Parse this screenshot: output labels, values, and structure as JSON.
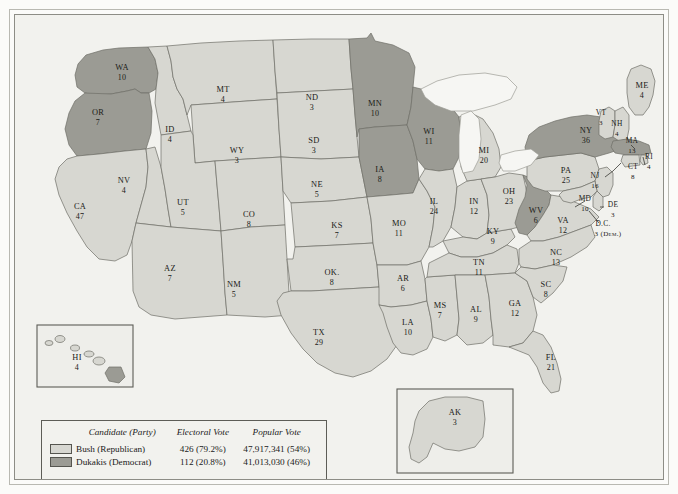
{
  "map": {
    "title": "1988 Presidential Election Electoral Vote Map",
    "colors": {
      "republican": "#d7d7d1",
      "democrat": "#9b9b94",
      "border": "#6e6e67",
      "lake": "#f6f6f3",
      "frame": "#5d5d57"
    }
  },
  "legend": {
    "headers": {
      "candidate": "Candidate (Party)",
      "electoral": "Electoral Vote",
      "popular": "Popular Vote"
    },
    "rows": [
      {
        "swatch": "republican",
        "candidate": "Bush (Republican)",
        "electoral": "426 (79.2%)",
        "popular": "47,917,341 (54%)"
      },
      {
        "swatch": "democrat",
        "candidate": "Dukakis (Democrat)",
        "electoral": "112 (20.8%)",
        "popular": "41,013,030 (46%)"
      }
    ]
  },
  "insets": {
    "hawaii_label": "HI",
    "alaska_label": "AK"
  },
  "states": [
    {
      "code": "WA",
      "votes": "10",
      "party": "democrat",
      "lx": 107,
      "ly": 55,
      "nx": 107,
      "ny": 65
    },
    {
      "code": "OR",
      "votes": "7",
      "party": "democrat",
      "lx": 83,
      "ly": 100,
      "nx": 83,
      "ny": 110
    },
    {
      "code": "CA",
      "votes": "47",
      "party": "republican",
      "lx": 65,
      "ly": 194,
      "nx": 65,
      "ny": 204
    },
    {
      "code": "NV",
      "votes": "4",
      "party": "republican",
      "lx": 109,
      "ly": 168,
      "nx": 109,
      "ny": 178
    },
    {
      "code": "ID",
      "votes": "4",
      "party": "republican",
      "lx": 155,
      "ly": 117,
      "nx": 155,
      "ny": 127
    },
    {
      "code": "MT",
      "votes": "4",
      "party": "republican",
      "lx": 208,
      "ly": 77,
      "nx": 208,
      "ny": 87
    },
    {
      "code": "WY",
      "votes": "3",
      "party": "republican",
      "lx": 222,
      "ly": 138,
      "nx": 222,
      "ny": 148
    },
    {
      "code": "UT",
      "votes": "5",
      "party": "republican",
      "lx": 168,
      "ly": 190,
      "nx": 168,
      "ny": 200
    },
    {
      "code": "AZ",
      "votes": "7",
      "party": "republican",
      "lx": 155,
      "ly": 256,
      "nx": 155,
      "ny": 266
    },
    {
      "code": "CO",
      "votes": "8",
      "party": "republican",
      "lx": 234,
      "ly": 202,
      "nx": 234,
      "ny": 212
    },
    {
      "code": "NM",
      "votes": "5",
      "party": "republican",
      "lx": 219,
      "ly": 272,
      "nx": 219,
      "ny": 282
    },
    {
      "code": "ND",
      "votes": "3",
      "party": "republican",
      "lx": 297,
      "ly": 85,
      "nx": 297,
      "ny": 95
    },
    {
      "code": "SD",
      "votes": "3",
      "party": "republican",
      "lx": 299,
      "ly": 128,
      "nx": 299,
      "ny": 138
    },
    {
      "code": "NE",
      "votes": "5",
      "party": "republican",
      "lx": 302,
      "ly": 172,
      "nx": 302,
      "ny": 182
    },
    {
      "code": "KS",
      "votes": "7",
      "party": "republican",
      "lx": 322,
      "ly": 213,
      "nx": 322,
      "ny": 223
    },
    {
      "code": "OK.",
      "votes": "8",
      "party": "republican",
      "lx": 317,
      "ly": 260,
      "nx": 317,
      "ny": 270
    },
    {
      "code": "TX",
      "votes": "29",
      "party": "republican",
      "lx": 304,
      "ly": 320,
      "nx": 304,
      "ny": 330
    },
    {
      "code": "MN",
      "votes": "10",
      "party": "democrat",
      "lx": 360,
      "ly": 91,
      "nx": 360,
      "ny": 101
    },
    {
      "code": "IA",
      "votes": "8",
      "party": "democrat",
      "lx": 365,
      "ly": 157,
      "nx": 365,
      "ny": 167
    },
    {
      "code": "MO",
      "votes": "11",
      "party": "republican",
      "lx": 384,
      "ly": 211,
      "nx": 384,
      "ny": 221
    },
    {
      "code": "AR",
      "votes": "6",
      "party": "republican",
      "lx": 388,
      "ly": 266,
      "nx": 388,
      "ny": 276
    },
    {
      "code": "LA",
      "votes": "10",
      "party": "republican",
      "lx": 393,
      "ly": 310,
      "nx": 393,
      "ny": 320
    },
    {
      "code": "WI",
      "votes": "11",
      "party": "democrat",
      "lx": 414,
      "ly": 119,
      "nx": 414,
      "ny": 129
    },
    {
      "code": "IL",
      "votes": "24",
      "party": "republican",
      "lx": 419,
      "ly": 189,
      "nx": 419,
      "ny": 199
    },
    {
      "code": "MS",
      "votes": "7",
      "party": "republican",
      "lx": 425,
      "ly": 293,
      "nx": 425,
      "ny": 303
    },
    {
      "code": "IN",
      "votes": "12",
      "party": "republican",
      "lx": 459,
      "ly": 189,
      "nx": 459,
      "ny": 199
    },
    {
      "code": "MI",
      "votes": "20",
      "party": "republican",
      "lx": 469,
      "ly": 138,
      "nx": 469,
      "ny": 148
    },
    {
      "code": "KY",
      "votes": "9",
      "party": "republican",
      "lx": 478,
      "ly": 219,
      "nx": 478,
      "ny": 229
    },
    {
      "code": "TN",
      "votes": "11",
      "party": "republican",
      "lx": 464,
      "ly": 250,
      "nx": 464,
      "ny": 260
    },
    {
      "code": "AL",
      "votes": "9",
      "party": "republican",
      "lx": 461,
      "ly": 297,
      "nx": 461,
      "ny": 307
    },
    {
      "code": "OH",
      "votes": "23",
      "party": "republican",
      "lx": 494,
      "ly": 179,
      "nx": 494,
      "ny": 189
    },
    {
      "code": "GA",
      "votes": "12",
      "party": "republican",
      "lx": 500,
      "ly": 291,
      "nx": 500,
      "ny": 301
    },
    {
      "code": "WV",
      "votes": "6",
      "party": "democrat",
      "lx": 521,
      "ly": 198,
      "nx": 521,
      "ny": 208
    },
    {
      "code": "VA",
      "votes": "12",
      "party": "republican",
      "lx": 548,
      "ly": 208,
      "nx": 548,
      "ny": 218
    },
    {
      "code": "NC",
      "votes": "13",
      "party": "republican",
      "lx": 541,
      "ly": 240,
      "nx": 541,
      "ny": 250
    },
    {
      "code": "SC",
      "votes": "8",
      "party": "republican",
      "lx": 531,
      "ly": 272,
      "nx": 531,
      "ny": 282
    },
    {
      "code": "FL",
      "votes": "21",
      "party": "republican",
      "lx": 536,
      "ly": 345,
      "nx": 536,
      "ny": 355
    },
    {
      "code": "PA",
      "votes": "25",
      "party": "republican",
      "lx": 551,
      "ly": 158,
      "nx": 551,
      "ny": 168
    },
    {
      "code": "NY",
      "votes": "36",
      "party": "democrat",
      "lx": 571,
      "ly": 118,
      "nx": 571,
      "ny": 128
    },
    {
      "code": "ME",
      "votes": "4",
      "party": "republican",
      "lx": 627,
      "ly": 73,
      "nx": 627,
      "ny": 83
    },
    {
      "code": "VT",
      "votes": "3",
      "party": "republican",
      "lx": 586,
      "ly": 100,
      "nx": 586,
      "ny": 110
    },
    {
      "code": "NH",
      "votes": "4",
      "party": "republican",
      "lx": 602,
      "ly": 111,
      "nx": 602,
      "ny": 121
    },
    {
      "code": "MA",
      "votes": "13",
      "party": "democrat",
      "lx": 617,
      "ly": 128,
      "nx": 617,
      "ny": 138
    },
    {
      "code": "RI",
      "votes": "4",
      "party": "republican",
      "lx": 634,
      "ly": 144,
      "nx": 634,
      "ny": 154
    },
    {
      "code": "CT",
      "votes": "8",
      "party": "republican",
      "lx": 618,
      "ly": 154,
      "nx": 618,
      "ny": 164
    },
    {
      "code": "NJ",
      "votes": "16",
      "party": "republican",
      "lx": 580,
      "ly": 163,
      "nx": 580,
      "ny": 173
    },
    {
      "code": "DE",
      "votes": "3",
      "party": "republican",
      "lx": 598,
      "ly": 192,
      "nx": 598,
      "ny": 202
    },
    {
      "code": "MD",
      "votes": "10",
      "party": "republican",
      "lx": 570,
      "ly": 186,
      "nx": 570,
      "ny": 196
    },
    {
      "code": "D.C.",
      "votes": "3 (Dem.)",
      "party": "democrat",
      "lx": 588,
      "ly": 211,
      "nx": 593,
      "ny": 221
    },
    {
      "code": "HI",
      "votes": "4",
      "party": "republican",
      "lx": 62,
      "ly": 345,
      "nx": 62,
      "ny": 355
    },
    {
      "code": "AK",
      "votes": "3",
      "party": "republican",
      "lx": 440,
      "ly": 400,
      "nx": 440,
      "ny": 410
    }
  ]
}
